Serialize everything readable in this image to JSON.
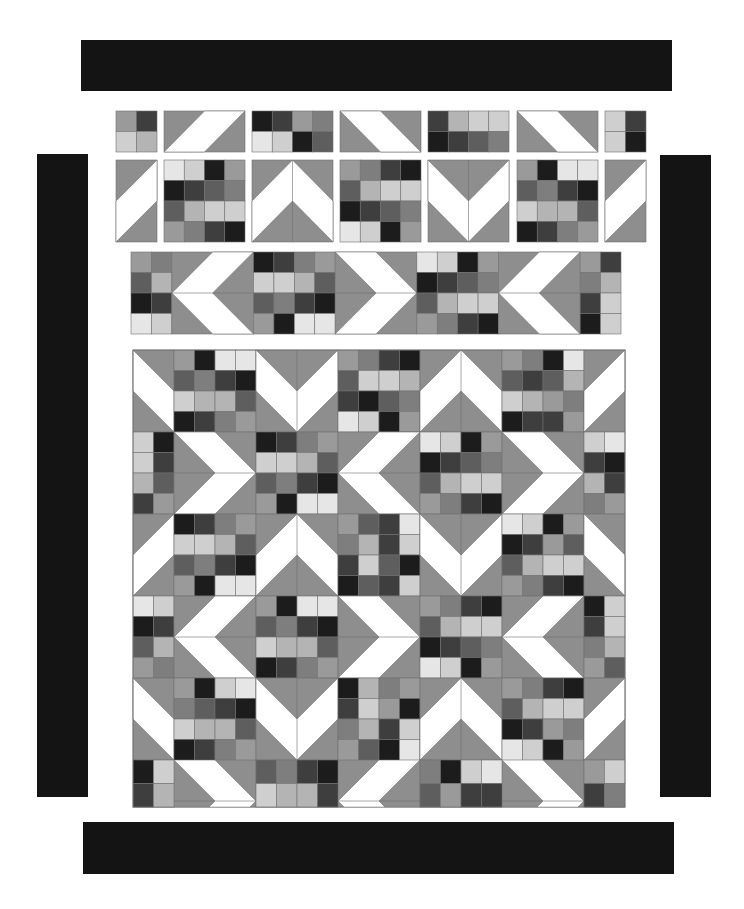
{
  "colors": {
    "border": "#141414",
    "background": "#8e8e8e",
    "white": "#ffffff",
    "seam": "#707070",
    "shades": [
      "#e6e6e6",
      "#cfcfcf",
      "#b4b4b4",
      "#9a9a9a",
      "#7e7e7e",
      "#5e5e5e",
      "#3e3e3e",
      "#1c1c1c"
    ]
  },
  "borders": [
    {
      "name": "top-border",
      "x": 81,
      "y": 40,
      "w": 591,
      "h": 51
    },
    {
      "name": "bottom-border",
      "x": 83,
      "y": 822,
      "w": 591,
      "h": 52
    },
    {
      "name": "left-border",
      "x": 37,
      "y": 154,
      "w": 51,
      "h": 643
    },
    {
      "name": "right-border",
      "x": 660,
      "y": 155,
      "w": 51,
      "h": 642
    }
  ],
  "exploded_pieces": [
    {
      "type": "patch",
      "x": 116,
      "y": 111,
      "w": 41,
      "h": 41,
      "cols": 2,
      "rows": 2,
      "cells": [
        3,
        6,
        1,
        2
      ]
    },
    {
      "type": "hst_bar",
      "dir": "up-right",
      "x": 164,
      "y": 111,
      "w": 81,
      "h": 41
    },
    {
      "type": "patch",
      "x": 252,
      "y": 111,
      "w": 81,
      "h": 41,
      "cols": 4,
      "rows": 2,
      "cells": [
        7,
        6,
        3,
        4,
        0,
        1,
        7,
        5
      ]
    },
    {
      "type": "hst_bar",
      "dir": "down-right",
      "x": 340,
      "y": 111,
      "w": 81,
      "h": 41
    },
    {
      "type": "patch",
      "x": 428,
      "y": 111,
      "w": 81,
      "h": 41,
      "cols": 4,
      "rows": 2,
      "cells": [
        6,
        2,
        1,
        1,
        7,
        6,
        5,
        4
      ]
    },
    {
      "type": "hst_bar",
      "dir": "down-right",
      "x": 517,
      "y": 111,
      "w": 81,
      "h": 41
    },
    {
      "type": "patch",
      "x": 605,
      "y": 111,
      "w": 41,
      "h": 41,
      "cols": 2,
      "rows": 2,
      "cells": [
        1,
        6,
        1,
        7
      ]
    },
    {
      "type": "hst_bar_v",
      "dir": "up-right",
      "x": 116,
      "y": 160,
      "w": 41,
      "h": 82
    },
    {
      "type": "patch",
      "x": 164,
      "y": 160,
      "w": 81,
      "h": 82,
      "cols": 4,
      "rows": 4,
      "cells": [
        0,
        1,
        7,
        3,
        7,
        6,
        5,
        4,
        5,
        2,
        1,
        1,
        3,
        4,
        6,
        7
      ]
    },
    {
      "type": "chevron",
      "dir": "up",
      "x": 252,
      "y": 160,
      "w": 81,
      "h": 82
    },
    {
      "type": "patch",
      "x": 340,
      "y": 160,
      "w": 81,
      "h": 82,
      "cols": 4,
      "rows": 4,
      "cells": [
        3,
        4,
        6,
        7,
        5,
        2,
        1,
        1,
        7,
        6,
        5,
        4,
        0,
        1,
        7,
        3
      ]
    },
    {
      "type": "chevron",
      "dir": "down",
      "x": 428,
      "y": 160,
      "w": 81,
      "h": 82
    },
    {
      "type": "patch",
      "x": 517,
      "y": 160,
      "w": 81,
      "h": 82,
      "cols": 4,
      "rows": 4,
      "cells": [
        3,
        7,
        0,
        0,
        5,
        4,
        6,
        7,
        1,
        2,
        2,
        5,
        7,
        6,
        4,
        3
      ]
    },
    {
      "type": "hst_bar_v",
      "dir": "up-right",
      "x": 605,
      "y": 160,
      "w": 41,
      "h": 82
    },
    {
      "type": "strip",
      "x": 131,
      "y": 252,
      "w": 490,
      "h": 82,
      "pieces": [
        {
          "type": "patch",
          "cols": 2,
          "rows": 4,
          "cells": [
            3,
            4,
            5,
            2,
            7,
            6,
            0,
            1
          ],
          "units": 2
        },
        {
          "type": "chevron",
          "dir": "left",
          "units": 4
        },
        {
          "type": "patch",
          "cols": 4,
          "rows": 4,
          "cells": [
            7,
            6,
            4,
            3,
            1,
            1,
            2,
            5,
            5,
            4,
            6,
            7,
            3,
            7,
            0,
            0
          ],
          "units": 4
        },
        {
          "type": "chevron",
          "dir": "right",
          "units": 4
        },
        {
          "type": "patch",
          "cols": 4,
          "rows": 4,
          "cells": [
            0,
            1,
            7,
            3,
            7,
            6,
            5,
            4,
            5,
            2,
            1,
            1,
            3,
            4,
            6,
            7
          ],
          "units": 4
        },
        {
          "type": "chevron",
          "dir": "left",
          "units": 4
        },
        {
          "type": "patch",
          "cols": 2,
          "rows": 4,
          "cells": [
            3,
            6,
            4,
            2,
            6,
            1,
            7,
            1
          ],
          "units": 2
        }
      ]
    }
  ],
  "quilt": {
    "x": 133,
    "y": 350,
    "unit": 20.5,
    "height_units": 22.3,
    "rows": [
      {
        "units": 4,
        "pieces": [
          {
            "type": "half_chevron",
            "dir": "down",
            "side": "right",
            "units": 2
          },
          {
            "type": "patch",
            "cols": 4,
            "rows": 4,
            "cells": [
              3,
              7,
              0,
              0,
              5,
              4,
              6,
              7,
              1,
              2,
              2,
              5,
              7,
              6,
              4,
              3
            ],
            "units": 4
          },
          {
            "type": "chevron",
            "dir": "down",
            "units": 4
          },
          {
            "type": "patch",
            "cols": 4,
            "rows": 4,
            "cells": [
              3,
              4,
              6,
              7,
              5,
              1,
              1,
              2,
              6,
              7,
              5,
              4,
              0,
              1,
              7,
              3
            ],
            "units": 4
          },
          {
            "type": "chevron",
            "dir": "up",
            "units": 4
          },
          {
            "type": "patch",
            "cols": 4,
            "rows": 4,
            "cells": [
              3,
              4,
              7,
              0,
              5,
              6,
              5,
              2,
              1,
              2,
              3,
              4,
              7,
              6,
              6,
              3
            ],
            "units": 4
          },
          {
            "type": "half_chevron",
            "dir": "down",
            "side": "left",
            "units": 2
          }
        ]
      },
      {
        "units": 4,
        "pieces": [
          {
            "type": "patch",
            "cols": 2,
            "rows": 4,
            "cells": [
              1,
              7,
              1,
              6,
              2,
              5,
              6,
              3
            ],
            "units": 2
          },
          {
            "type": "chevron",
            "dir": "right",
            "units": 4
          },
          {
            "type": "patch",
            "cols": 4,
            "rows": 4,
            "cells": [
              7,
              6,
              4,
              3,
              1,
              1,
              2,
              5,
              5,
              4,
              6,
              7,
              3,
              7,
              0,
              0
            ],
            "units": 4
          },
          {
            "type": "chevron",
            "dir": "left",
            "units": 4
          },
          {
            "type": "patch",
            "cols": 4,
            "rows": 4,
            "cells": [
              0,
              1,
              7,
              3,
              7,
              6,
              5,
              4,
              5,
              2,
              1,
              1,
              3,
              4,
              6,
              7
            ],
            "units": 4
          },
          {
            "type": "chevron",
            "dir": "right",
            "units": 4
          },
          {
            "type": "patch",
            "cols": 2,
            "rows": 4,
            "cells": [
              1,
              0,
              6,
              7,
              2,
              6,
              4,
              3
            ],
            "units": 2
          }
        ]
      },
      {
        "units": 4,
        "pieces": [
          {
            "type": "half_chevron",
            "dir": "up",
            "side": "right",
            "units": 2
          },
          {
            "type": "patch",
            "cols": 4,
            "rows": 4,
            "cells": [
              7,
              6,
              4,
              3,
              1,
              1,
              2,
              5,
              5,
              4,
              6,
              7,
              3,
              7,
              0,
              0
            ],
            "units": 4
          },
          {
            "type": "chevron",
            "dir": "up",
            "units": 4
          },
          {
            "type": "patch",
            "cols": 4,
            "rows": 4,
            "cells": [
              3,
              5,
              6,
              0,
              4,
              2,
              6,
              1,
              6,
              1,
              5,
              7,
              7,
              5,
              6,
              1
            ],
            "units": 4
          },
          {
            "type": "chevron",
            "dir": "down",
            "units": 4
          },
          {
            "type": "patch",
            "cols": 4,
            "rows": 4,
            "cells": [
              0,
              1,
              7,
              3,
              7,
              6,
              3,
              5,
              5,
              2,
              1,
              1,
              3,
              4,
              6,
              7
            ],
            "units": 4
          },
          {
            "type": "half_chevron",
            "dir": "up",
            "side": "left",
            "units": 2
          }
        ]
      },
      {
        "units": 4,
        "pieces": [
          {
            "type": "patch",
            "cols": 2,
            "rows": 4,
            "cells": [
              0,
              1,
              7,
              6,
              5,
              2,
              3,
              4
            ],
            "units": 2
          },
          {
            "type": "chevron",
            "dir": "left",
            "units": 4
          },
          {
            "type": "patch",
            "cols": 4,
            "rows": 4,
            "cells": [
              3,
              7,
              0,
              0,
              5,
              4,
              6,
              7,
              1,
              2,
              2,
              5,
              7,
              6,
              4,
              3
            ],
            "units": 4
          },
          {
            "type": "chevron",
            "dir": "right",
            "units": 4
          },
          {
            "type": "patch",
            "cols": 4,
            "rows": 4,
            "cells": [
              3,
              4,
              6,
              7,
              5,
              2,
              1,
              1,
              7,
              6,
              5,
              4,
              0,
              1,
              7,
              3
            ],
            "units": 4
          },
          {
            "type": "chevron",
            "dir": "left",
            "units": 4
          },
          {
            "type": "patch",
            "cols": 2,
            "rows": 4,
            "cells": [
              7,
              1,
              6,
              1,
              4,
              2,
              3,
              5
            ],
            "units": 2
          }
        ]
      },
      {
        "units": 4,
        "pieces": [
          {
            "type": "half_chevron",
            "dir": "down",
            "side": "right",
            "units": 2
          },
          {
            "type": "patch",
            "cols": 4,
            "rows": 4,
            "cells": [
              3,
              7,
              1,
              0,
              4,
              5,
              6,
              7,
              1,
              2,
              2,
              5,
              7,
              6,
              4,
              3
            ],
            "units": 4
          },
          {
            "type": "chevron",
            "dir": "down",
            "units": 4
          },
          {
            "type": "patch",
            "cols": 4,
            "rows": 4,
            "cells": [
              7,
              2,
              4,
              3,
              6,
              1,
              3,
              7,
              4,
              2,
              6,
              1,
              3,
              5,
              7,
              0
            ],
            "units": 4
          },
          {
            "type": "chevron",
            "dir": "up",
            "units": 4
          },
          {
            "type": "patch",
            "cols": 4,
            "rows": 4,
            "cells": [
              3,
              4,
              6,
              7,
              5,
              2,
              1,
              1,
              7,
              6,
              3,
              4,
              0,
              1,
              7,
              3
            ],
            "units": 4
          },
          {
            "type": "half_chevron",
            "dir": "down",
            "side": "left",
            "units": 2
          }
        ]
      },
      {
        "units": 2.3,
        "pieces": [
          {
            "type": "patch",
            "cols": 2,
            "rows": 2,
            "cells": [
              7,
              1,
              6,
              2
            ],
            "units": 2
          },
          {
            "type": "half_row_chevron",
            "dir": "right",
            "units": 4
          },
          {
            "type": "patch",
            "cols": 4,
            "rows": 2,
            "cells": [
              5,
              4,
              6,
              7,
              1,
              2,
              2,
              6
            ],
            "units": 4
          },
          {
            "type": "half_row_chevron",
            "dir": "left",
            "units": 4
          },
          {
            "type": "patch",
            "cols": 4,
            "rows": 2,
            "cells": [
              4,
              7,
              1,
              0,
              5,
              3,
              6,
              6
            ],
            "units": 4
          },
          {
            "type": "half_row_chevron",
            "dir": "right",
            "units": 4
          },
          {
            "type": "patch",
            "cols": 2,
            "rows": 2,
            "cells": [
              3,
              1,
              6,
              4
            ],
            "units": 2
          }
        ]
      }
    ]
  }
}
